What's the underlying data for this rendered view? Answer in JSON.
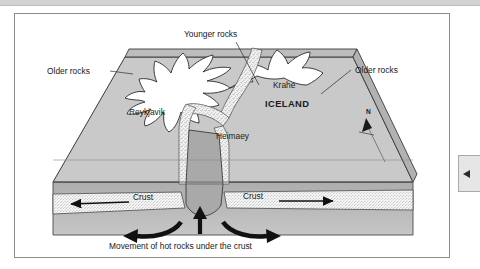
{
  "document": {
    "frame_visible": true,
    "background": "#ffffff",
    "border_color": "#8c8c8c"
  },
  "edge_tab": {
    "name": "collapse-panel-tab",
    "arrow_glyph": "left-arrow",
    "background": "#e6e6e6"
  },
  "diagram": {
    "type": "geological-block-diagram",
    "labels": {
      "younger_rocks": "Younger rocks",
      "older_rocks_left": "Older rocks",
      "older_rocks_right": "Older rocks",
      "krahe": "Krahe",
      "iceland": "ICELAND",
      "reykjavik": "Reykjavik",
      "heimaey": "Heimaey",
      "crust_left": "Crust",
      "crust_right": "Crust",
      "caption": "Movement of hot rocks under the crust",
      "north": "N"
    },
    "colors": {
      "surface": "#c8c8c8",
      "surface_rim": "#b4b4b4",
      "island": "#ffffff",
      "rift_stipple": "#e8e8e8",
      "magma_column": "#a9a9a9",
      "crust_band": "#f2f2f2",
      "mantle": "#b0b0b0",
      "outline": "#2b2b2b",
      "arrow": "#111111"
    },
    "arrows": [
      {
        "name": "crust-arrow-left",
        "direction": "left"
      },
      {
        "name": "crust-arrow-right",
        "direction": "right"
      },
      {
        "name": "magma-arrow-up",
        "direction": "up"
      },
      {
        "name": "convection-arrow-left",
        "direction": "curve-left"
      },
      {
        "name": "convection-arrow-right",
        "direction": "curve-right"
      },
      {
        "name": "north-arrow",
        "direction": "up-right"
      }
    ]
  }
}
